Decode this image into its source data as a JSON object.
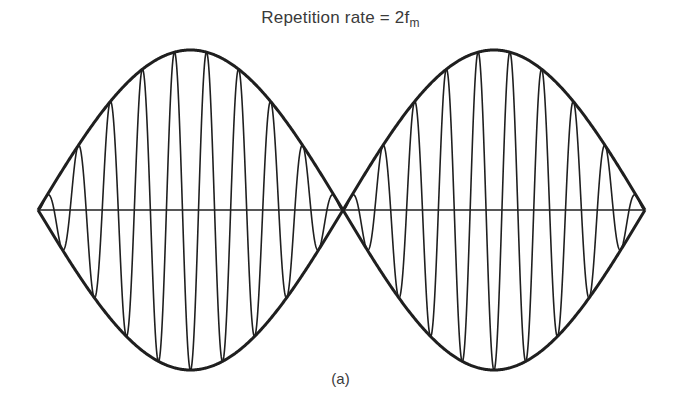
{
  "figure": {
    "title_main": "Repetition rate = 2f",
    "title_subscript": "m",
    "caption": "(a)"
  },
  "diagram": {
    "type": "amplitude-modulated waveform (envelope lobes)",
    "axis": {
      "x_start": 38,
      "x_end": 645,
      "y": 210
    },
    "lobes": [
      {
        "x_start": 38,
        "x_end": 343,
        "amplitude": 160,
        "carrier_cycles": 9.5
      },
      {
        "x_start": 343,
        "x_end": 645,
        "amplitude": 160,
        "carrier_cycles": 9.5
      }
    ],
    "stroke_color": "#1f1f1f",
    "envelope_width": 3,
    "carrier_width": 1.6,
    "axis_width": 1.6
  }
}
